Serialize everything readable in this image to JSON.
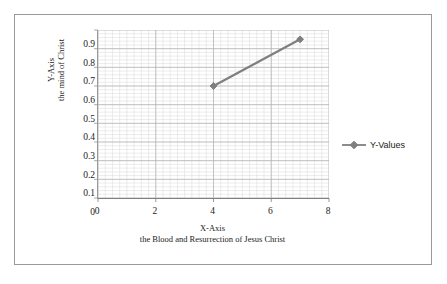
{
  "chart_data": {
    "type": "line",
    "title": "",
    "xlabel": "X-Axis",
    "xlabel_sub": "the Blood and Resurrection of Jesus Christ",
    "ylabel": "Y-Axis",
    "ylabel_sub": "the mind of Christ",
    "series": [
      {
        "name": "Y-Values",
        "x": [
          4,
          7
        ],
        "values": [
          0.6,
          0.85
        ],
        "color": "#7f7f7f",
        "marker": "diamond"
      }
    ],
    "xlim": [
      0,
      8
    ],
    "ylim": [
      0,
      0.9
    ],
    "x_ticks": [
      0,
      2,
      4,
      6,
      8
    ],
    "x_tick_labels": [
      "0",
      "2",
      "4",
      "6",
      "8"
    ],
    "y_ticks": [
      0,
      0.1,
      0.2,
      0.3,
      0.4,
      0.5,
      0.6,
      0.7,
      0.8,
      0.9
    ],
    "y_tick_labels": [
      "0",
      "0.1",
      "0.2",
      "0.3",
      "0.4",
      "0.5",
      "0.6",
      "0.7",
      "0.8",
      "0.9"
    ],
    "grid": true,
    "grid_major_color": "#b0b0b0",
    "grid_minor_color": "#d8d8d8",
    "x_minor_step": 0.25,
    "y_minor_step": 0.02,
    "legend_position": "right",
    "legend_entries": [
      "Y-Values"
    ],
    "border_color": "#9a9a9a",
    "background": "#ffffff"
  }
}
